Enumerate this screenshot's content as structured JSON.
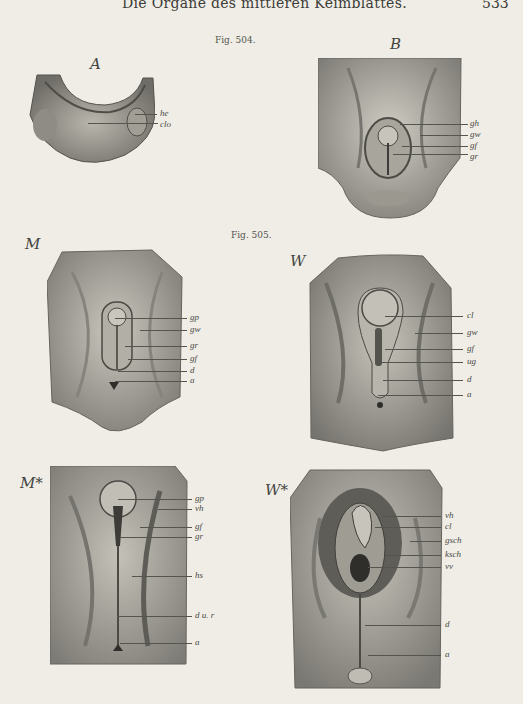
{
  "header": {
    "running_title": "Die Organe des mittleren Keimblattes.",
    "page_number": "533"
  },
  "figures": [
    {
      "caption": "Fig. 504.",
      "panels": [
        {
          "letter": "A",
          "labels": [
            "he",
            "clo"
          ]
        },
        {
          "letter": "B",
          "labels": [
            "gh",
            "gw",
            "gf",
            "gr"
          ]
        }
      ]
    },
    {
      "caption": "Fig. 505.",
      "panels": [
        {
          "letter": "M",
          "labels": [
            "gp",
            "gw",
            "gr",
            "gf",
            "d",
            "a"
          ]
        },
        {
          "letter": "W",
          "labels": [
            "cl",
            "gw",
            "gf",
            "ug",
            "d",
            "a"
          ]
        },
        {
          "letter": "M*",
          "labels": [
            "gp",
            "vh",
            "gf",
            "gr",
            "hs",
            "d u. r",
            "a"
          ]
        },
        {
          "letter": "W*",
          "labels": [
            "vh",
            "cl",
            "gsch",
            "ksch",
            "vv",
            "d",
            "a"
          ]
        }
      ]
    }
  ],
  "colors": {
    "paper": "#efede6",
    "ink": "#3a3a36",
    "specimen_light": "#c9c6bd",
    "specimen_dark": "#6d6b65"
  }
}
